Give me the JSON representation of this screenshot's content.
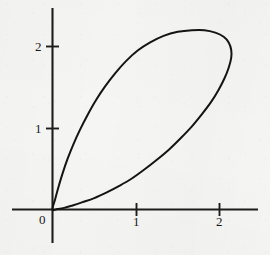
{
  "figure": {
    "kind": "mathematical-plot",
    "background_color": "#f5f5f3",
    "ink_color": "#141414",
    "axis_color": "#1d1d1d"
  },
  "chart_data": {
    "type": "line",
    "title": "",
    "subtitle": "",
    "xlabel": "",
    "ylabel": "",
    "grid": false,
    "legend": null,
    "curve_name": "closed loop curve with node at origin",
    "closed": true,
    "xlim": [
      -0.48,
      2.45
    ],
    "ylim": [
      -0.42,
      2.45
    ],
    "xticks": [
      1,
      2
    ],
    "xtick_labels": [
      "1",
      "2"
    ],
    "yticks": [
      1,
      2
    ],
    "ytick_labels": [
      "1",
      "2"
    ],
    "origin_label": "0",
    "annotations": [
      {
        "text": "0",
        "x": 0,
        "y": 0,
        "role": "origin-label"
      }
    ],
    "features": {
      "node_point": [
        0,
        0
      ],
      "top_vertex": [
        1.82,
        2.2
      ],
      "rightmost_point": [
        2.14,
        1.96
      ],
      "upper_branch_slope_at_origin": 3.9,
      "lower_branch_slope_at_origin": 0.06
    },
    "points": [
      [
        0.0,
        0.0
      ],
      [
        0.03,
        0.12
      ],
      [
        0.07,
        0.27
      ],
      [
        0.12,
        0.44
      ],
      [
        0.18,
        0.62
      ],
      [
        0.25,
        0.8
      ],
      [
        0.33,
        0.98
      ],
      [
        0.42,
        1.16
      ],
      [
        0.52,
        1.34
      ],
      [
        0.63,
        1.51
      ],
      [
        0.75,
        1.67
      ],
      [
        0.88,
        1.82
      ],
      [
        1.02,
        1.95
      ],
      [
        1.17,
        2.05
      ],
      [
        1.33,
        2.13
      ],
      [
        1.5,
        2.18
      ],
      [
        1.67,
        2.2
      ],
      [
        1.82,
        2.2
      ],
      [
        1.95,
        2.17
      ],
      [
        2.05,
        2.12
      ],
      [
        2.11,
        2.05
      ],
      [
        2.14,
        1.96
      ],
      [
        2.14,
        1.86
      ],
      [
        2.11,
        1.74
      ],
      [
        2.06,
        1.61
      ],
      [
        1.99,
        1.47
      ],
      [
        1.9,
        1.32
      ],
      [
        1.79,
        1.17
      ],
      [
        1.67,
        1.02
      ],
      [
        1.54,
        0.88
      ],
      [
        1.4,
        0.74
      ],
      [
        1.25,
        0.61
      ],
      [
        1.1,
        0.49
      ],
      [
        0.95,
        0.38
      ],
      [
        0.8,
        0.29
      ],
      [
        0.65,
        0.21
      ],
      [
        0.5,
        0.14
      ],
      [
        0.36,
        0.09
      ],
      [
        0.24,
        0.05
      ],
      [
        0.14,
        0.02
      ],
      [
        0.06,
        0.006
      ],
      [
        0.0,
        0.0
      ]
    ]
  },
  "axes": {
    "x_axis_name": "horizontal-axis",
    "y_axis_name": "vertical-axis"
  }
}
